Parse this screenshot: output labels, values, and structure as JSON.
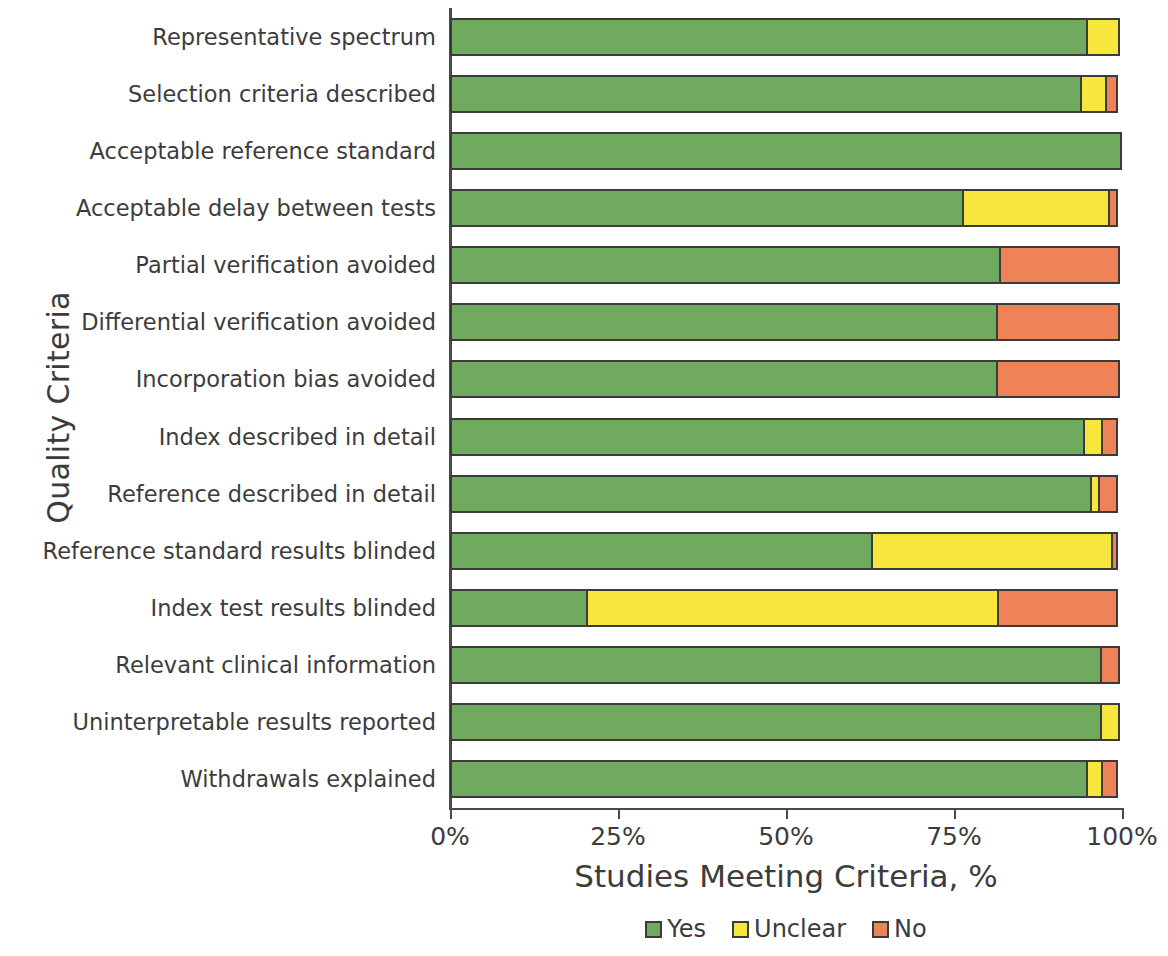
{
  "chart_data": {
    "type": "bar",
    "subtype": "stacked-horizontal-100pct",
    "title": "",
    "xlabel": "Studies Meeting Criteria, %",
    "ylabel": "Quality Criteria",
    "xlim": [
      0,
      100
    ],
    "xticks": [
      "0%",
      "25%",
      "50%",
      "75%",
      "100%"
    ],
    "xtick_values": [
      0,
      25,
      50,
      75,
      100
    ],
    "grid": false,
    "legend_position": "bottom-center",
    "categories": [
      "Representative spectrum",
      "Selection criteria described",
      "Acceptable reference standard",
      "Acceptable delay between tests",
      "Partial verification avoided",
      "Differential verification avoided",
      "Incorporation bias avoided",
      "Index described in detail",
      "Reference described in detail",
      "Reference standard results blinded",
      "Index test results blinded",
      "Relevant clinical information",
      "Uninterpretable results reported",
      "Withdrawals explained"
    ],
    "series": [
      {
        "name": "Yes",
        "color": "#6faa5e",
        "values": [
          95,
          94,
          100,
          76.5,
          82,
          81.5,
          81.5,
          94.5,
          95.5,
          63,
          20.5,
          97,
          97,
          95
        ]
      },
      {
        "name": "Unclear",
        "color": "#f7e63c",
        "values": [
          5,
          4,
          0,
          22,
          0,
          0,
          0,
          3,
          1.5,
          36,
          61.5,
          0,
          3,
          2.5
        ]
      },
      {
        "name": "No",
        "color": "#f08257",
        "values": [
          0,
          2,
          0,
          1.5,
          18,
          18.5,
          18.5,
          2.5,
          3,
          1,
          18,
          3,
          0,
          2.5
        ]
      }
    ],
    "legend": [
      {
        "label": "Yes",
        "color": "#6faa5e"
      },
      {
        "label": "Unclear",
        "color": "#f7e63c"
      },
      {
        "label": "No",
        "color": "#f08257"
      }
    ]
  }
}
